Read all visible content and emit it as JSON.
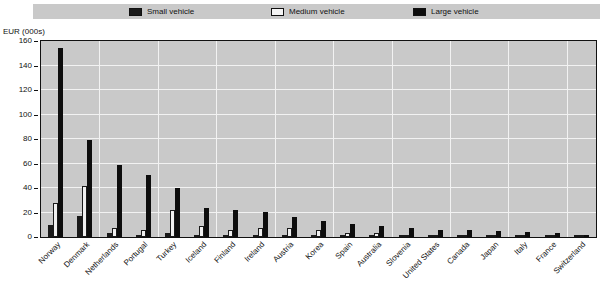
{
  "axis_title": "EUR (000s)",
  "legend": {
    "items": [
      {
        "label": "Small vehicle",
        "key": "small",
        "color": "#1a1a1a",
        "fill": "solid",
        "x": 129
      },
      {
        "label": "Medium vehicle",
        "key": "medium",
        "color": "#f0f0f0",
        "fill": "hollow",
        "x": 271
      },
      {
        "label": "Large vehicle",
        "key": "large",
        "color": "#0d0d0d",
        "fill": "solid",
        "x": 413
      }
    ]
  },
  "chart_data": {
    "type": "bar",
    "title": "",
    "xlabel": "",
    "ylabel": "EUR (000s)",
    "ylim": [
      0,
      160
    ],
    "yticks": [
      0,
      20,
      40,
      60,
      80,
      100,
      120,
      140,
      160
    ],
    "grid": true,
    "legend_position": "top",
    "categories": [
      "Norway",
      "Denmark",
      "Netherlands",
      "Portugal",
      "Turkey",
      "Iceland",
      "Finland",
      "Ireland",
      "Austria",
      "Korea",
      "Spain",
      "Australia",
      "Slovenia",
      "United States",
      "Canada",
      "Japan",
      "Italy",
      "France",
      "Switzerland"
    ],
    "series": [
      {
        "name": "Small vehicle",
        "color": "#1a1a1a",
        "values": [
          10,
          17,
          3,
          2,
          3,
          1,
          1,
          2,
          1,
          1,
          1,
          1,
          1,
          1,
          1,
          1,
          1,
          0.5,
          0.5
        ]
      },
      {
        "name": "Medium vehicle",
        "color": "#f0f0f0",
        "values": [
          28,
          42,
          7,
          6,
          22,
          9,
          6,
          7,
          7,
          6,
          3,
          3,
          2,
          2,
          2,
          1,
          1,
          1,
          1
        ]
      },
      {
        "name": "Large vehicle",
        "color": "#0d0d0d",
        "values": [
          154,
          79,
          59,
          51,
          40,
          24,
          22,
          20,
          16,
          13,
          11,
          9,
          7,
          6,
          6,
          5,
          4,
          3,
          2
        ]
      }
    ]
  }
}
